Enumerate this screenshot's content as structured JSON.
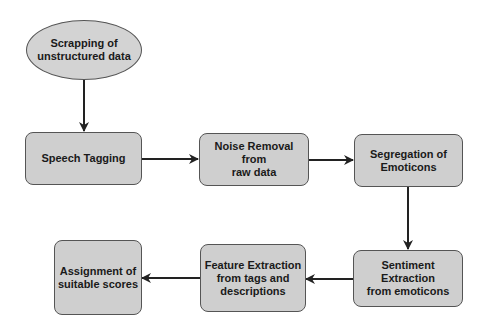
{
  "diagram": {
    "type": "flowchart",
    "colors": {
      "node_fill": "#cfcfcf",
      "border": "#555555",
      "arrow": "#222222",
      "text": "#1a1a1a"
    },
    "nodes": [
      {
        "id": "scrapping",
        "shape": "ellipse",
        "label": "Scrapping of\nunstructured data"
      },
      {
        "id": "speech_tagging",
        "shape": "rounded-rect",
        "label": "Speech Tagging"
      },
      {
        "id": "noise_removal",
        "shape": "rounded-rect",
        "label": "Noise Removal from\nraw data"
      },
      {
        "id": "segregation",
        "shape": "rounded-rect",
        "label": "Segregation of\nEmoticons"
      },
      {
        "id": "sentiment",
        "shape": "rounded-rect",
        "label": "Sentiment\nExtraction\nfrom emoticons"
      },
      {
        "id": "feature",
        "shape": "rounded-rect",
        "label": "Feature Extraction\nfrom tags and\ndescriptions"
      },
      {
        "id": "assignment",
        "shape": "rounded-rect",
        "label": "Assignment of\nsuitable scores"
      }
    ],
    "edges": [
      {
        "from": "scrapping",
        "to": "speech_tagging"
      },
      {
        "from": "speech_tagging",
        "to": "noise_removal"
      },
      {
        "from": "noise_removal",
        "to": "segregation"
      },
      {
        "from": "segregation",
        "to": "sentiment"
      },
      {
        "from": "sentiment",
        "to": "feature"
      },
      {
        "from": "feature",
        "to": "assignment"
      }
    ]
  }
}
